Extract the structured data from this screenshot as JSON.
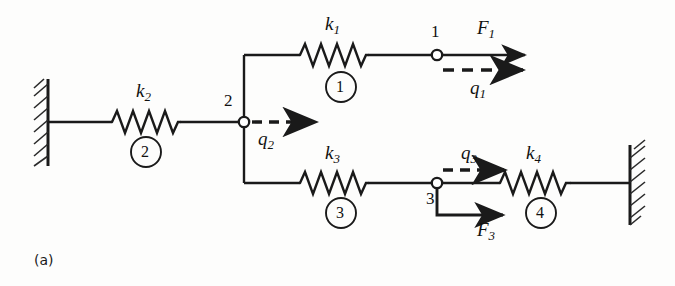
{
  "figure": {
    "caption": "(a)",
    "type": "spring-system-schematic",
    "title": "",
    "background_color": "#fdfdfc",
    "line_color": "#1a1a1a"
  },
  "springs": [
    {
      "id": "k1",
      "symbol": "k",
      "subscript": "1",
      "element_number": "1",
      "x1": 300,
      "x2": 368,
      "y": 55
    },
    {
      "id": "k2",
      "symbol": "k",
      "subscript": "2",
      "element_number": "2",
      "x1": 112,
      "x2": 180,
      "y": 122
    },
    {
      "id": "k3",
      "symbol": "k",
      "subscript": "3",
      "element_number": "3",
      "x1": 300,
      "x2": 368,
      "y": 183
    },
    {
      "id": "k4",
      "symbol": "k",
      "subscript": "4",
      "element_number": "4",
      "x1": 500,
      "x2": 570,
      "y": 183
    }
  ],
  "nodes": [
    {
      "id": "node1",
      "label": "1",
      "x": 437,
      "y": 55
    },
    {
      "id": "node2",
      "label": "2",
      "x": 244,
      "y": 122
    },
    {
      "id": "node3",
      "label": "3",
      "x": 437,
      "y": 183
    }
  ],
  "forces": [
    {
      "id": "F1",
      "symbol": "F",
      "subscript": "1",
      "node": "1",
      "direction": "right",
      "style": "solid"
    },
    {
      "id": "F3",
      "symbol": "F",
      "subscript": "3",
      "node": "3",
      "direction": "right",
      "style": "solid"
    }
  ],
  "displacements": [
    {
      "id": "q1",
      "symbol": "q",
      "subscript": "1",
      "node": "1",
      "direction": "right",
      "style": "dashed"
    },
    {
      "id": "q2",
      "symbol": "q",
      "subscript": "2",
      "node": "2",
      "direction": "right",
      "style": "dashed"
    },
    {
      "id": "q3",
      "symbol": "q",
      "subscript": "3",
      "node": "3",
      "direction": "right",
      "style": "dashed"
    }
  ],
  "walls": [
    {
      "id": "left-wall",
      "side": "left",
      "x": 48,
      "y_top": 80,
      "y_bottom": 165
    },
    {
      "id": "right-wall",
      "side": "right",
      "x": 630,
      "y_top": 146,
      "y_bottom": 224
    }
  ],
  "labels": {
    "k1": "k",
    "k1_sub": "1",
    "k2": "k",
    "k2_sub": "2",
    "k3": "k",
    "k3_sub": "3",
    "k4": "k",
    "k4_sub": "4",
    "F1": "F",
    "F1_sub": "1",
    "F3": "F",
    "F3_sub": "3",
    "q1": "q",
    "q1_sub": "1",
    "q2": "q",
    "q2_sub": "2",
    "q3": "q",
    "q3_sub": "3",
    "node1": "1",
    "node2": "2",
    "node3": "3",
    "elem1": "1",
    "elem2": "2",
    "elem3": "3",
    "elem4": "4",
    "caption": "(a)"
  }
}
